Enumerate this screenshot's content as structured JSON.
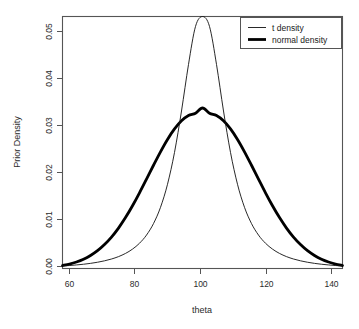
{
  "chart_data": {
    "type": "line",
    "title": "",
    "subtitle": "",
    "xlabel": "theta",
    "ylabel": "Prior Density",
    "xlim": [
      60,
      140
    ],
    "ylim": [
      0.0,
      0.0515
    ],
    "grid": false,
    "legend_position": "top-right",
    "xticks": [
      60,
      80,
      100,
      120,
      140
    ],
    "xtick_labels": [
      "60",
      "80",
      "100",
      "120",
      "140"
    ],
    "yticks": [
      0.0,
      0.01,
      0.02,
      0.03,
      0.04,
      0.05
    ],
    "ytick_labels": [
      "0.00",
      "0.01",
      "0.02",
      "0.03",
      "0.04",
      "0.05"
    ],
    "annotations": [],
    "series": [
      {
        "name": "t density",
        "style": "thin",
        "linewidth": 1,
        "color": "#111111",
        "peak_x": 100,
        "peak_y": 0.0515,
        "x": [
          60,
          62,
          64,
          66,
          68,
          70,
          72,
          74,
          76,
          78,
          80,
          82,
          84,
          86,
          88,
          90,
          92,
          94,
          96,
          98,
          100,
          102,
          104,
          106,
          108,
          110,
          112,
          114,
          116,
          118,
          120,
          122,
          124,
          126,
          128,
          130,
          132,
          134,
          136,
          138,
          140
        ],
        "y": [
          0.00052,
          0.00061,
          0.00073,
          0.00087,
          0.00105,
          0.00128,
          0.00157,
          0.00194,
          0.00243,
          0.00308,
          0.00396,
          0.00516,
          0.00683,
          0.00918,
          0.0125,
          0.01721,
          0.02372,
          0.03219,
          0.0417,
          0.04947,
          0.0515,
          0.04947,
          0.0417,
          0.03219,
          0.02372,
          0.01721,
          0.0125,
          0.00918,
          0.00683,
          0.00516,
          0.00396,
          0.00308,
          0.00243,
          0.00194,
          0.00157,
          0.00128,
          0.00105,
          0.00087,
          0.00073,
          0.00061,
          0.00052
        ]
      },
      {
        "name": "normal density",
        "style": "thick",
        "linewidth": 3,
        "color": "#000000",
        "peak_x": 100,
        "peak_y": 0.0328,
        "x": [
          60,
          62,
          64,
          66,
          68,
          70,
          72,
          74,
          76,
          78,
          80,
          82,
          84,
          86,
          88,
          90,
          92,
          94,
          96,
          98,
          100,
          102,
          104,
          106,
          108,
          110,
          112,
          114,
          116,
          118,
          120,
          122,
          124,
          126,
          128,
          130,
          132,
          134,
          136,
          138,
          140
        ],
        "y": [
          0.00061,
          0.00091,
          0.00133,
          0.0019,
          0.00266,
          0.00364,
          0.00489,
          0.00642,
          0.00826,
          0.0104,
          0.01282,
          0.01547,
          0.01827,
          0.0211,
          0.02385,
          0.02637,
          0.02852,
          0.03018,
          0.03126,
          0.03174,
          0.0328,
          0.03174,
          0.03126,
          0.03018,
          0.02852,
          0.02637,
          0.02385,
          0.0211,
          0.01827,
          0.01547,
          0.01282,
          0.0104,
          0.00826,
          0.00642,
          0.00489,
          0.00364,
          0.00266,
          0.0019,
          0.00133,
          0.00091,
          0.00061
        ]
      }
    ]
  },
  "legend": {
    "entries": [
      {
        "label": "t density"
      },
      {
        "label": "normal density"
      }
    ]
  },
  "axes": {
    "x_title": "theta",
    "y_title": "Prior Density"
  }
}
